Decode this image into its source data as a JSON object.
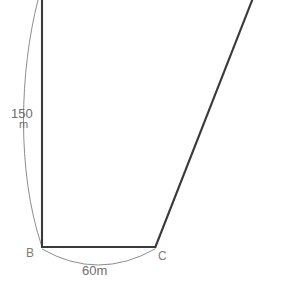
{
  "figure": {
    "type": "geometry-diagram",
    "background_color": "#ffffff",
    "line_color": "#3a3a3a",
    "dimension_color": "#8d8d8d",
    "text_color": "#6e6e6e",
    "vertices": [
      {
        "id": "B",
        "label": "B",
        "x": 42,
        "y": 247
      },
      {
        "id": "C",
        "label": "C",
        "x": 155,
        "y": 247
      }
    ],
    "edges": [
      {
        "id": "left-side",
        "from": [
          42,
          0
        ],
        "to": [
          42,
          247
        ],
        "style": "solid"
      },
      {
        "id": "base-BC",
        "from": [
          42,
          247
        ],
        "to": [
          155,
          247
        ],
        "style": "solid"
      },
      {
        "id": "right-side",
        "from": [
          155,
          247
        ],
        "to": [
          252,
          0
        ],
        "style": "solid"
      }
    ],
    "dimensions": [
      {
        "id": "left-dimension",
        "value": "150",
        "unit": "m",
        "label_x": 22,
        "label_y": 113,
        "arc": "M 38 0 C 20 70, 16 170, 42 247"
      },
      {
        "id": "base-dimension",
        "value": "60m",
        "unit": "",
        "label_x": 98,
        "label_y": 270,
        "arc": "M 42 249 Q 98 281, 155 249"
      }
    ],
    "vertex_labels": [
      {
        "id": "label-B",
        "text": "B",
        "x": 28,
        "y": 256
      },
      {
        "id": "label-C",
        "text": "C",
        "x": 159,
        "y": 259
      }
    ],
    "dimension_texts": {
      "left_value": "150",
      "left_unit": "m",
      "base_value": "60m"
    }
  }
}
